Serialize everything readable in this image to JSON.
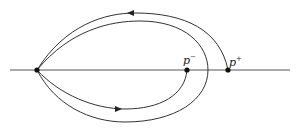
{
  "diagram": {
    "axis": {
      "x1": 10,
      "x2": 290,
      "y": 70
    },
    "nodes": [
      {
        "id": "origin",
        "x": 37,
        "y": 70,
        "label": ""
      },
      {
        "id": "p-minus",
        "x": 187,
        "y": 70,
        "label": "p",
        "sup": "−"
      },
      {
        "id": "p-plus",
        "x": 228,
        "y": 70,
        "label": "p",
        "sup": "+"
      }
    ],
    "labels": {
      "p_minus": "p",
      "p_minus_sup": "−",
      "p_plus": "p",
      "p_plus_sup": "+"
    },
    "stroke_color": "#333333"
  }
}
